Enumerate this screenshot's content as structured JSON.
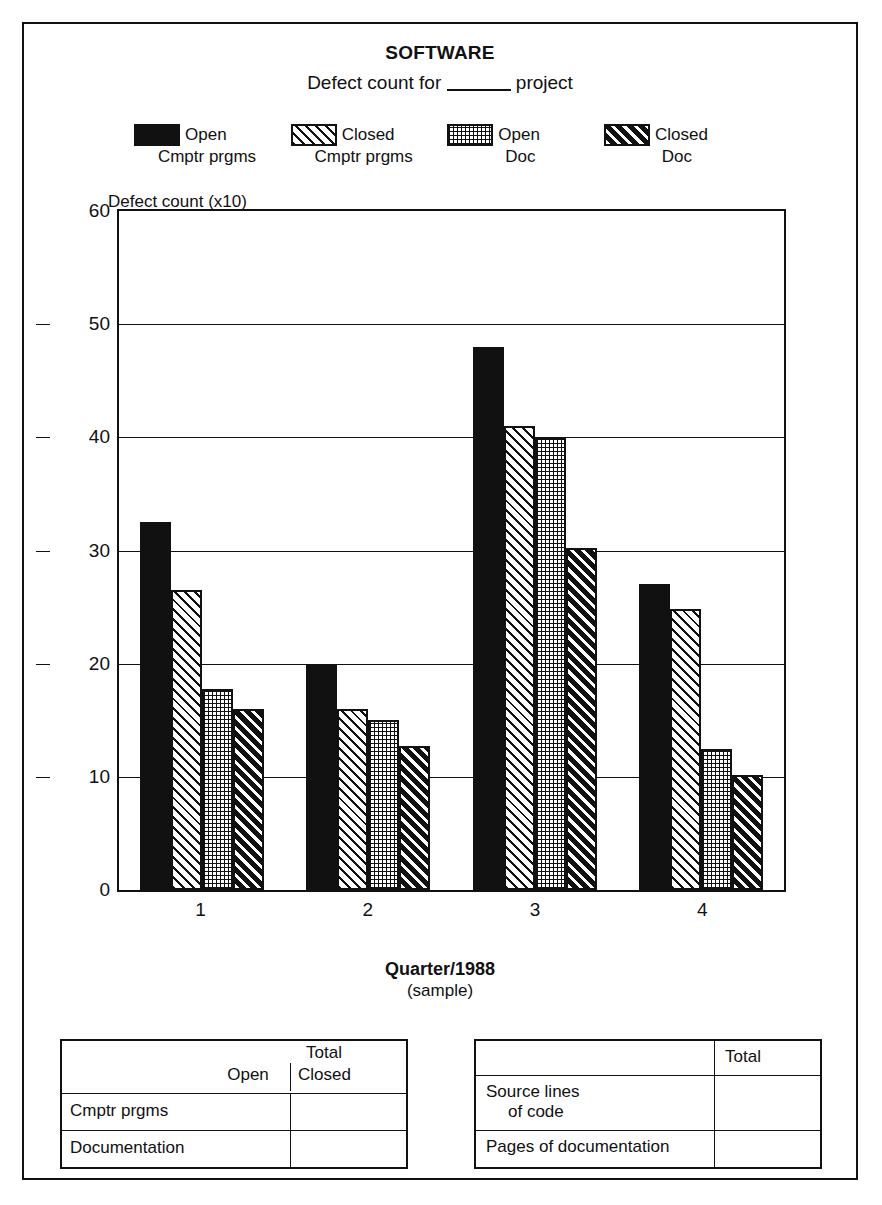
{
  "chart_data": {
    "type": "bar",
    "title": "SOFTWARE",
    "subtitle_prefix": "Defect count for",
    "subtitle_suffix": "project",
    "ylabel": "Defect count (x10)",
    "xlabel": "Quarter/1988",
    "xlabel_sub": "(sample)",
    "categories": [
      "1",
      "2",
      "3",
      "4"
    ],
    "ylim": [
      0,
      60
    ],
    "yticks": [
      0,
      10,
      20,
      30,
      40,
      50,
      60
    ],
    "grid": true,
    "legend_position": "top",
    "series": [
      {
        "name": "Open",
        "sub": "Cmptr prgms",
        "pattern": "solid-black",
        "values": [
          32.5,
          20.0,
          48.0,
          27.0
        ]
      },
      {
        "name": "Closed",
        "sub": "Cmptr prgms",
        "pattern": "diagonal-hatch",
        "values": [
          26.5,
          16.0,
          41.0,
          24.8
        ]
      },
      {
        "name": "Open",
        "sub": "Doc",
        "pattern": "dot-grid",
        "values": [
          17.8,
          15.0,
          40.0,
          12.5
        ]
      },
      {
        "name": "Closed",
        "sub": "Doc",
        "pattern": "black-diagonal-hatch",
        "values": [
          16.0,
          12.7,
          30.2,
          10.2
        ]
      }
    ]
  },
  "colors": {
    "ink": "#111111",
    "paper": "#ffffff"
  },
  "table_left": {
    "header_span": "Total",
    "header_sub": [
      "Open",
      "Closed"
    ],
    "rows": [
      {
        "name": "Cmptr prgms",
        "open": "",
        "closed": ""
      },
      {
        "name": "Documentation",
        "open": "",
        "closed": ""
      }
    ]
  },
  "table_right": {
    "header_blank": "",
    "header_total": "Total",
    "rows": [
      {
        "name_line1": "Source lines",
        "name_line2": "of code",
        "total": ""
      },
      {
        "name_line1": "Pages of documentation",
        "name_line2": "",
        "total": ""
      }
    ]
  }
}
